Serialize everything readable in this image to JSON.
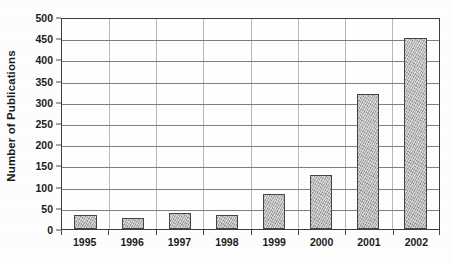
{
  "chart_data": {
    "type": "bar",
    "title": "",
    "subtitle": "",
    "xlabel": "",
    "ylabel": "Number of Publications",
    "categories": [
      "1995",
      "1996",
      "1997",
      "1998",
      "1999",
      "2000",
      "2001",
      "2002"
    ],
    "values": [
      32,
      25,
      38,
      32,
      82,
      127,
      318,
      450
    ],
    "ylim": [
      0,
      500
    ],
    "ytick_step": 50,
    "yticks": [
      0,
      50,
      100,
      150,
      200,
      250,
      300,
      350,
      400,
      450,
      500
    ],
    "ytick_labels": [
      "0",
      "50",
      "100",
      "150",
      "200",
      "250",
      "300",
      "350",
      "400",
      "450",
      "500"
    ],
    "grid": true,
    "grid_axis": "y",
    "legend": false,
    "legend_position": "none",
    "bar_color": "#a9a9a9",
    "bar_border_color": "#454545",
    "axis_color": "#3d3d3d",
    "gridline_color": "#5c5c5c",
    "text_color": "#1b1b1b",
    "background_color": "#ffffff"
  }
}
